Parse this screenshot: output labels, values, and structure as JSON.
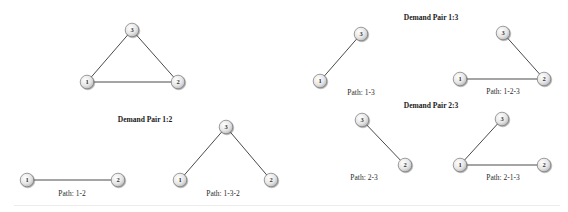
{
  "colors": {
    "edge": "#4a4a4a",
    "node_fill_light": "#ffffff",
    "node_fill_dark": "#c8c8c8",
    "node_stroke": "#7a7a7a",
    "text": "#222222"
  },
  "graphs": [
    {
      "id": "full",
      "title": "",
      "path_label": "",
      "nodes": [
        {
          "id": "3",
          "label": "3",
          "x": 132,
          "y": 30
        },
        {
          "id": "1",
          "label": "1",
          "x": 87,
          "y": 82
        },
        {
          "id": "2",
          "label": "2",
          "x": 178,
          "y": 82
        }
      ],
      "edges": [
        [
          "1",
          "3"
        ],
        [
          "3",
          "2"
        ],
        [
          "1",
          "2"
        ]
      ]
    },
    {
      "id": "pair12-a",
      "path_label": "Path: 1-2",
      "label_pos": {
        "x": 72,
        "y": 189
      },
      "nodes": [
        {
          "id": "1",
          "label": "1",
          "x": 27,
          "y": 180
        },
        {
          "id": "2",
          "label": "2",
          "x": 118,
          "y": 180
        }
      ],
      "edges": [
        [
          "1",
          "2"
        ]
      ]
    },
    {
      "id": "pair12-b",
      "path_label": "Path: 1-3-2",
      "label_pos": {
        "x": 223,
        "y": 189
      },
      "nodes": [
        {
          "id": "3",
          "label": "3",
          "x": 226,
          "y": 127
        },
        {
          "id": "1",
          "label": "1",
          "x": 180,
          "y": 180
        },
        {
          "id": "2",
          "label": "2",
          "x": 271,
          "y": 180
        }
      ],
      "edges": [
        [
          "1",
          "3"
        ],
        [
          "3",
          "2"
        ]
      ]
    },
    {
      "id": "pair13-a",
      "path_label": "Path: 1-3",
      "label_pos": {
        "x": 361,
        "y": 88
      },
      "nodes": [
        {
          "id": "3",
          "label": "3",
          "x": 361,
          "y": 34
        },
        {
          "id": "1",
          "label": "1",
          "x": 320,
          "y": 81
        }
      ],
      "edges": [
        [
          "1",
          "3"
        ]
      ]
    },
    {
      "id": "pair13-b",
      "path_label": "Path: 1-2-3",
      "label_pos": {
        "x": 503,
        "y": 87
      },
      "nodes": [
        {
          "id": "3",
          "label": "3",
          "x": 503,
          "y": 33
        },
        {
          "id": "1",
          "label": "1",
          "x": 460,
          "y": 79
        },
        {
          "id": "2",
          "label": "2",
          "x": 544,
          "y": 79
        }
      ],
      "edges": [
        [
          "1",
          "2"
        ],
        [
          "2",
          "3"
        ]
      ]
    },
    {
      "id": "pair23-a",
      "path_label": "Path: 2-3",
      "label_pos": {
        "x": 364,
        "y": 173
      },
      "nodes": [
        {
          "id": "3",
          "label": "3",
          "x": 362,
          "y": 120
        },
        {
          "id": "2",
          "label": "2",
          "x": 405,
          "y": 165
        }
      ],
      "edges": [
        [
          "3",
          "2"
        ]
      ]
    },
    {
      "id": "pair23-b",
      "path_label": "Path: 2-1-3",
      "label_pos": {
        "x": 503,
        "y": 173
      },
      "nodes": [
        {
          "id": "3",
          "label": "3",
          "x": 502,
          "y": 119
        },
        {
          "id": "1",
          "label": "1",
          "x": 460,
          "y": 165
        },
        {
          "id": "2",
          "label": "2",
          "x": 544,
          "y": 165
        }
      ],
      "edges": [
        [
          "2",
          "1"
        ],
        [
          "1",
          "3"
        ]
      ]
    }
  ],
  "titles": [
    {
      "id": "pair12",
      "text": "Demand Pair 1:2",
      "x": 145,
      "y": 115
    },
    {
      "id": "pair13",
      "text": "Demand Pair 1:3",
      "x": 431,
      "y": 13
    },
    {
      "id": "pair23",
      "text": "Demand Pair 2:3",
      "x": 431,
      "y": 101
    }
  ]
}
